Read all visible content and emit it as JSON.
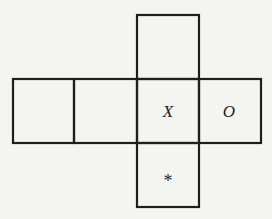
{
  "diagram": {
    "type": "cube-net",
    "faces": [
      {
        "id": "top",
        "label": ""
      },
      {
        "id": "row-1",
        "label": ""
      },
      {
        "id": "row-2",
        "label": ""
      },
      {
        "id": "row-3",
        "label": "X"
      },
      {
        "id": "row-4",
        "label": "O"
      },
      {
        "id": "bottom",
        "label": "*"
      }
    ],
    "colors": {
      "line": "#1e1e1e",
      "background": "#f4f4f2"
    }
  }
}
